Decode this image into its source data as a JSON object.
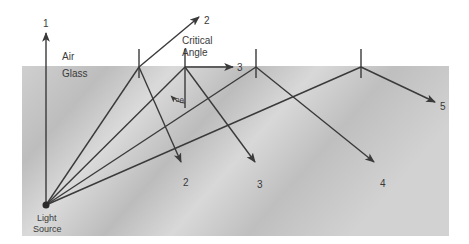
{
  "diagram": {
    "media": {
      "upper": "Air",
      "lower": "Glass"
    },
    "source_label_line1": "Light",
    "source_label_line2": "Source",
    "critical_angle_label_line1": "Critical",
    "critical_angle_label_line2": "Angle",
    "theta_label": "θc",
    "rays": [
      {
        "id": "1",
        "label": "1",
        "description": "Perpendicular ray passes straight into air"
      },
      {
        "id": "2",
        "label": "2",
        "description": "Refracted into air; partially reflected back into glass"
      },
      {
        "id": "3",
        "label": "3",
        "description": "At critical angle; refracted along surface, reflected into glass"
      },
      {
        "id": "4",
        "label": "4",
        "description": "Beyond critical angle; totally internally reflected"
      },
      {
        "id": "5",
        "label": "5",
        "description": "Beyond critical angle; totally internally reflected"
      }
    ],
    "reflected_labels": {
      "ray2": "2",
      "ray3": "3",
      "ray4": "4",
      "ray5": "5"
    },
    "colors": {
      "line": "#3a3a3a",
      "glass_light": "#d8d8d8",
      "glass_dark": "#b8b8b8",
      "background": "#ffffff"
    }
  }
}
